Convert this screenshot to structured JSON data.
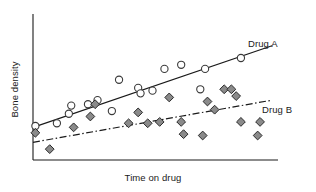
{
  "chart_data": {
    "type": "scatter",
    "title": "",
    "xlabel": "Time on drug",
    "ylabel": "Bone density",
    "xlim": [
      0,
      100
    ],
    "ylim": [
      0,
      100
    ],
    "grid": false,
    "axis_ticks": false,
    "legend_position": "inline-right",
    "series": [
      {
        "name": "Drug A",
        "label": "Drug A",
        "marker": "open-circle",
        "marker_fill": "#ffffff",
        "marker_stroke": "#3a3a3a",
        "trendline_style": "solid",
        "trendline_color": "#1a1a1a",
        "trendline": {
          "x1": 0,
          "y1": 24,
          "x2": 100,
          "y2": 84
        },
        "points": [
          {
            "x": 1,
            "y": 25
          },
          {
            "x": 10,
            "y": 27
          },
          {
            "x": 15,
            "y": 34
          },
          {
            "x": 16,
            "y": 40
          },
          {
            "x": 23,
            "y": 41
          },
          {
            "x": 27,
            "y": 44
          },
          {
            "x": 33,
            "y": 36
          },
          {
            "x": 36,
            "y": 59
          },
          {
            "x": 44,
            "y": 53
          },
          {
            "x": 45,
            "y": 49
          },
          {
            "x": 50,
            "y": 51
          },
          {
            "x": 55,
            "y": 67
          },
          {
            "x": 62,
            "y": 70
          },
          {
            "x": 70,
            "y": 52
          },
          {
            "x": 72,
            "y": 67
          },
          {
            "x": 87,
            "y": 75
          }
        ]
      },
      {
        "name": "Drug B",
        "label": "Drug B",
        "marker": "filled-diamond",
        "marker_fill": "#8a8a8a",
        "marker_stroke": "#2b2b2b",
        "trendline_style": "dash-dot",
        "trendline_color": "#1a1a1a",
        "trendline": {
          "x1": 0,
          "y1": 13,
          "x2": 100,
          "y2": 44
        },
        "points": [
          {
            "x": 1,
            "y": 20
          },
          {
            "x": 7,
            "y": 8
          },
          {
            "x": 17,
            "y": 24
          },
          {
            "x": 24,
            "y": 32
          },
          {
            "x": 26,
            "y": 41
          },
          {
            "x": 40,
            "y": 27
          },
          {
            "x": 44,
            "y": 35
          },
          {
            "x": 48,
            "y": 27
          },
          {
            "x": 53,
            "y": 28
          },
          {
            "x": 57,
            "y": 46
          },
          {
            "x": 62,
            "y": 28
          },
          {
            "x": 63,
            "y": 19
          },
          {
            "x": 71,
            "y": 18
          },
          {
            "x": 73,
            "y": 43
          },
          {
            "x": 76,
            "y": 37
          },
          {
            "x": 80,
            "y": 52
          },
          {
            "x": 83,
            "y": 52
          },
          {
            "x": 85,
            "y": 47
          },
          {
            "x": 87,
            "y": 28
          },
          {
            "x": 95,
            "y": 28
          },
          {
            "x": 94,
            "y": 18
          }
        ]
      }
    ],
    "axes": {
      "x_axis_color": "#1a1a1a",
      "y_axis_color": "#1a1a1a"
    }
  }
}
